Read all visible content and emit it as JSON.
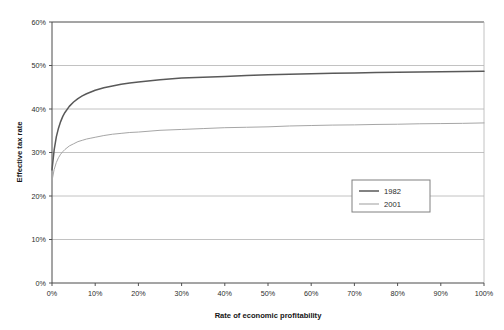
{
  "chart_data": {
    "type": "line",
    "title": "",
    "xlabel": "Rate of economic profitability",
    "ylabel": "Effective tax rate",
    "xlim": [
      0,
      100
    ],
    "ylim": [
      0,
      60
    ],
    "grid": true,
    "grid_axis": "y",
    "legend_position": "inside-lower-right",
    "x_tick_labels": [
      "0%",
      "10%",
      "20%",
      "30%",
      "40%",
      "50%",
      "60%",
      "70%",
      "80%",
      "90%",
      "100%"
    ],
    "x_ticks": [
      0,
      10,
      20,
      30,
      40,
      50,
      60,
      70,
      80,
      90,
      100
    ],
    "y_tick_labels": [
      "0%",
      "10%",
      "20%",
      "30%",
      "40%",
      "50%",
      "60%"
    ],
    "y_ticks": [
      0,
      10,
      20,
      30,
      40,
      50,
      60
    ],
    "x": [
      0,
      0.5,
      1,
      1.5,
      2,
      2.5,
      3,
      4,
      5,
      6,
      7,
      8,
      9,
      10,
      12,
      14,
      16,
      18,
      20,
      25,
      30,
      35,
      40,
      45,
      50,
      55,
      60,
      65,
      70,
      75,
      80,
      85,
      90,
      95,
      100
    ],
    "series": [
      {
        "name": "1982",
        "color": "#595959",
        "width": 1.5,
        "values": [
          26.0,
          30.6,
          33.6,
          35.6,
          37.1,
          38.3,
          39.2,
          40.6,
          41.6,
          42.4,
          43.0,
          43.5,
          43.9,
          44.3,
          44.9,
          45.3,
          45.7,
          46.0,
          46.2,
          46.7,
          47.1,
          47.3,
          47.5,
          47.7,
          47.9,
          48.0,
          48.1,
          48.2,
          48.3,
          48.4,
          48.45,
          48.5,
          48.55,
          48.6,
          48.7
        ]
      },
      {
        "name": "2001",
        "color": "#a6a6a6",
        "width": 1.0,
        "values": [
          23.5,
          26.1,
          27.7,
          28.8,
          29.6,
          30.2,
          30.7,
          31.5,
          32.0,
          32.5,
          32.8,
          33.1,
          33.3,
          33.5,
          33.9,
          34.2,
          34.4,
          34.6,
          34.7,
          35.1,
          35.3,
          35.5,
          35.7,
          35.8,
          35.9,
          36.1,
          36.2,
          36.3,
          36.35,
          36.45,
          36.5,
          36.6,
          36.65,
          36.7,
          36.8
        ]
      }
    ]
  },
  "legend": {
    "entries": [
      {
        "label": "1982"
      },
      {
        "label": "2001"
      }
    ]
  },
  "colors": {
    "series_1982": "#595959",
    "series_2001": "#a6a6a6",
    "gridline": "#b3b3b3",
    "axis": "#404040",
    "plot_background": "#ffffff",
    "text": "#2b2b2b"
  }
}
